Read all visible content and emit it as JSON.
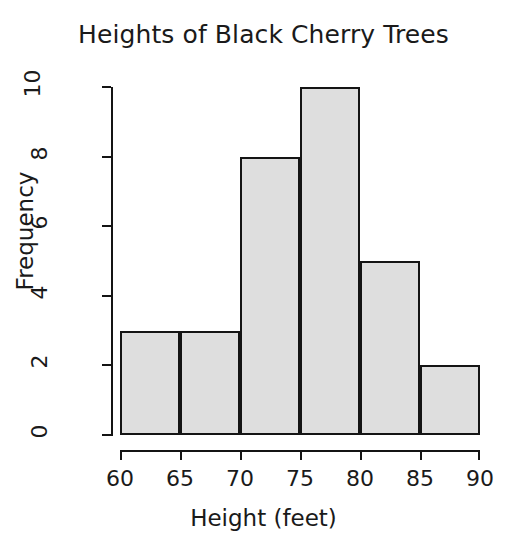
{
  "chart_data": {
    "type": "bar",
    "title": "Heights of Black Cherry Trees",
    "xlabel": "Height (feet)",
    "ylabel": "Frequency",
    "bin_edges": [
      60,
      65,
      70,
      75,
      80,
      85,
      90
    ],
    "bin_width": 5,
    "categories": [
      "60-65",
      "65-70",
      "70-75",
      "75-80",
      "80-85",
      "85-90"
    ],
    "values": [
      3,
      3,
      8,
      10,
      5,
      2
    ],
    "bars": [
      {
        "label": "60-65",
        "x0": 60,
        "x1": 65,
        "value": 3
      },
      {
        "label": "65-70",
        "x0": 65,
        "x1": 70,
        "value": 3
      },
      {
        "label": "70-75",
        "x0": 70,
        "x1": 75,
        "value": 8
      },
      {
        "label": "75-80",
        "x0": 75,
        "x1": 80,
        "value": 10
      },
      {
        "label": "80-85",
        "x0": 80,
        "x1": 85,
        "value": 5
      },
      {
        "label": "85-90",
        "x0": 85,
        "x1": 90,
        "value": 2
      }
    ],
    "xlim": [
      60,
      90
    ],
    "ylim": [
      0,
      10
    ],
    "xticks": [
      60,
      65,
      70,
      75,
      80,
      85,
      90
    ],
    "xtick_labels": [
      "60",
      "65",
      "70",
      "75",
      "80",
      "85",
      "90"
    ],
    "yticks": [
      0,
      2,
      4,
      6,
      8,
      10
    ],
    "ytick_labels": [
      "0",
      "2",
      "4",
      "6",
      "8",
      "10"
    ],
    "grid": false,
    "legend": false,
    "bar_fill_color": "#dedede",
    "bar_border_color": "#141414",
    "axis_color": "#141414",
    "text_color": "#1a1a1a",
    "background_color": "#ffffff"
  }
}
